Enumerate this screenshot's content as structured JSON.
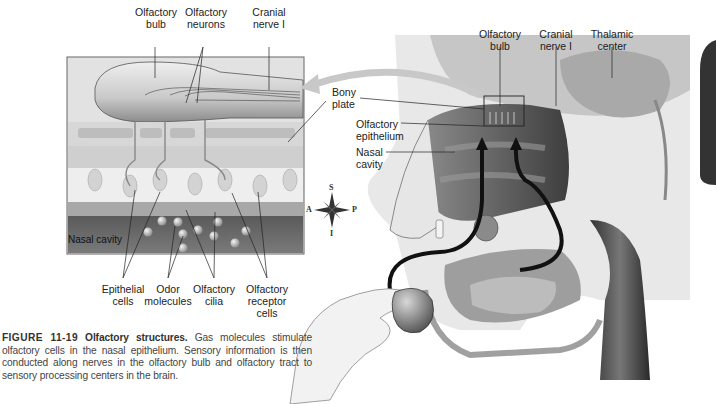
{
  "inset": {
    "top_labels": [
      {
        "id": "olfactory-bulb",
        "line1": "Olfactory",
        "line2": "bulb"
      },
      {
        "id": "olfactory-neurons",
        "line1": "Olfactory",
        "line2": "neurons"
      },
      {
        "id": "cranial-nerve-i",
        "line1": "Cranial",
        "line2": "nerve I"
      }
    ],
    "inner_label": "Nasal cavity",
    "bottom_labels": [
      {
        "id": "epithelial-cells",
        "line1": "Epithelial",
        "line2": "cells",
        "line3": ""
      },
      {
        "id": "odor-molecules",
        "line1": "Odor",
        "line2": "molecules",
        "line3": ""
      },
      {
        "id": "olfactory-cilia",
        "line1": "Olfactory",
        "line2": "cilia",
        "line3": ""
      },
      {
        "id": "olfactory-receptor-cells",
        "line1": "Olfactory",
        "line2": "receptor",
        "line3": "cells"
      }
    ]
  },
  "head": {
    "top_labels": [
      {
        "id": "olfactory-bulb",
        "line1": "Olfactory",
        "line2": "bulb"
      },
      {
        "id": "cranial-nerve-i",
        "line1": "Cranial",
        "line2": "nerve I"
      },
      {
        "id": "thalamic-center",
        "line1": "Thalamic",
        "line2": "center"
      }
    ],
    "side_labels": [
      {
        "id": "bony-plate",
        "line1": "Bony",
        "line2": "plate"
      },
      {
        "id": "olfactory-epithelium",
        "line1": "Olfactory",
        "line2": "epithelium"
      },
      {
        "id": "nasal-cavity",
        "line1": "Nasal",
        "line2": "cavity"
      }
    ]
  },
  "compass": {
    "superior": "S",
    "inferior": "I",
    "anterior": "A",
    "posterior": "P"
  },
  "caption": {
    "figure_number": "FIGURE 11-19",
    "title": "Olfactory structures.",
    "text": "Gas molecules stimulate olfactory cells in the nasal epithelium. Sensory information is then conducted along nerves in the olfactory bulb and olfactory tract to sensory processing centers in the brain."
  },
  "colors": {
    "label_text": "#222222",
    "caption_text": "#444444",
    "arrow_dark": "#111111",
    "arrow_light": "#c8c8c8",
    "nasal_cavity_dark": "#4a4a4a"
  }
}
